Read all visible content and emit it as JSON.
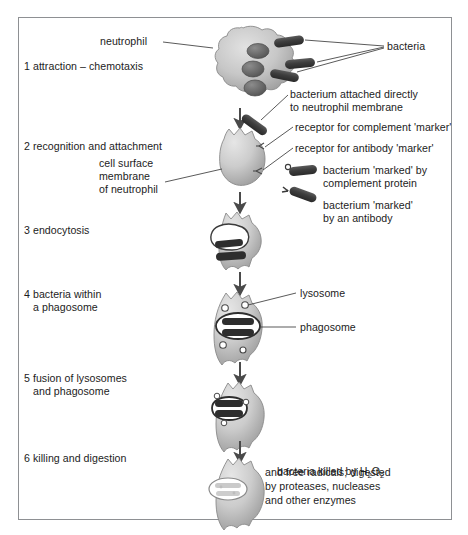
{
  "figure": {
    "border_color": "#8e9093",
    "background_color": "#ffffff",
    "cell_fill_light": "#d9d9d9",
    "cell_fill_mid": "#b3b3b3",
    "cell_fill_dark": "#8f8f8f",
    "bacteria_color": "#3b3b3b",
    "leader_line_color": "#3c3c3c",
    "arrow_color": "#4a4a4a"
  },
  "steps": [
    {
      "number": "1",
      "label": "1 attraction – chemotaxis"
    },
    {
      "number": "2",
      "label": "2 recognition and attachment"
    },
    {
      "number": "3",
      "label": "3 endocytosis"
    },
    {
      "number": "4",
      "label_line1": "4 bacteria within",
      "label_line2": "a phagosome"
    },
    {
      "number": "5",
      "label_line1": "5 fusion of lysosomes",
      "label_line2": "and phagosome"
    },
    {
      "number": "6",
      "label": "6 killing and digestion"
    }
  ],
  "annotations": {
    "neutrophil": "neutrophil",
    "bacteria": "bacteria",
    "attached_line1": "bacterium attached directly",
    "attached_line2": "to neutrophil membrane",
    "receptor_complement": "receptor for complement 'marker'",
    "receptor_antibody": "receptor for antibody 'marker'",
    "membrane_line1": "cell surface",
    "membrane_line2": "membrane",
    "membrane_line3": "of neutrophil",
    "marked_complement_line1": "bacterium 'marked' by",
    "marked_complement_line2": "complement protein",
    "marked_antibody_line1": "bacterium 'marked'",
    "marked_antibody_line2": "by an antibody",
    "lysosome": "lysosome",
    "phagosome": "phagosome",
    "killing_line1": "bacteria killed by H",
    "killing_line1_sub1": "2",
    "killing_line1_mid": "O",
    "killing_line1_sub2": "2",
    "killing_line2": "and free radicals; digested",
    "killing_line3": "by proteases, nucleases",
    "killing_line4": "and other enzymes"
  }
}
